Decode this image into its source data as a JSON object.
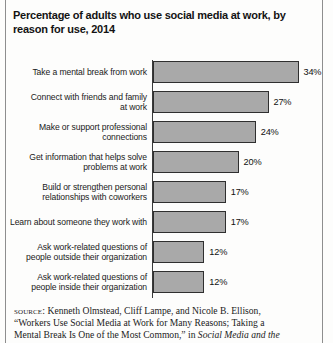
{
  "title": "Percentage of adults who use social media at work, by reason for use, 2014",
  "chart_data": {
    "type": "bar",
    "orientation": "horizontal",
    "title": "Percentage of adults who use social media at work, by reason for use, 2014",
    "xlabel": "",
    "ylabel": "",
    "xlim": [
      0,
      40
    ],
    "grid": false,
    "legend": "none",
    "categories": [
      "Take a mental break from work",
      "Connect with friends and family at work",
      "Make or support professional connections",
      "Get information that helps solve problems at work",
      "Build or strengthen personal relationships with coworkers",
      "Learn about someone they work with",
      "Ask work-related questions of people outside their organization",
      "Ask work-related questions of people inside their organization"
    ],
    "values": [
      34,
      27,
      24,
      20,
      17,
      17,
      12,
      12
    ],
    "value_labels": [
      "34%",
      "27%",
      "24%",
      "20%",
      "17%",
      "17%",
      "12%",
      "12%"
    ],
    "bar_color": "#a9a9a9",
    "bar_border_color": "#2f2f2f"
  },
  "bars": [
    {
      "label_line1": "Take a mental break from work",
      "label_line2": "",
      "value": 34,
      "value_label": "34%"
    },
    {
      "label_line1": "Connect with friends and family",
      "label_line2": "at work",
      "value": 27,
      "value_label": "27%"
    },
    {
      "label_line1": "Make or support professional",
      "label_line2": "connections",
      "value": 24,
      "value_label": "24%"
    },
    {
      "label_line1": "Get information that helps solve",
      "label_line2": "problems at work",
      "value": 20,
      "value_label": "20%"
    },
    {
      "label_line1": "Build or strengthen personal",
      "label_line2": "relationships with coworkers",
      "value": 17,
      "value_label": "17%"
    },
    {
      "label_line1": "Learn about someone they work with",
      "label_line2": "",
      "value": 17,
      "value_label": "17%"
    },
    {
      "label_line1": "Ask work-related questions of",
      "label_line2": "people outside their organization",
      "value": 12,
      "value_label": "12%"
    },
    {
      "label_line1": "Ask work-related questions of",
      "label_line2": "people inside their organization",
      "value": 12,
      "value_label": "12%"
    }
  ],
  "source": {
    "label": "SOURCE:",
    "line1": " Kenneth Olmstead, Cliff Lampe, and Nicole B. Ellison,",
    "line2": "“Workers Use Social Media at Work for Many Reasons; Taking a",
    "line3_plain": "Mental Break Is One of the Most Common,” in ",
    "line3_italic": "Social Media and the"
  }
}
